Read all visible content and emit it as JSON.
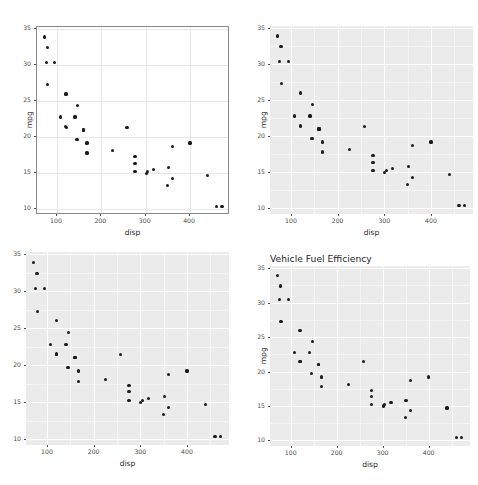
{
  "figure": {
    "kind": "scatterplot-matrix",
    "panel_count": 4,
    "background_color": "#ffffff",
    "point_color": "#1a1a1a"
  },
  "chart_data": [
    {
      "id": "top-left",
      "type": "scatter",
      "title": "",
      "xlabel": "disp",
      "ylabel": "mpg",
      "theme": "theme_bw",
      "panel_fill": "#ffffff",
      "panel_border": "#888888",
      "grid_color": "#e8e8e8",
      "grid": true,
      "legend": "none",
      "xlim": [
        55,
        490
      ],
      "ylim": [
        9.2,
        35.3
      ],
      "xticks": [
        100,
        200,
        300,
        400
      ],
      "yticks": [
        10,
        15,
        20,
        25,
        30,
        35
      ],
      "x": [
        160,
        160,
        108,
        258,
        360,
        225,
        360,
        146.7,
        140.8,
        167.6,
        167.6,
        275.8,
        275.8,
        275.8,
        472,
        460,
        440,
        78.7,
        75.7,
        71.1,
        120.1,
        318,
        304,
        350,
        400,
        79,
        120.3,
        95.1,
        351,
        145,
        301,
        121
      ],
      "y": [
        21,
        21,
        22.8,
        21.4,
        18.7,
        18.1,
        14.3,
        24.4,
        22.8,
        19.2,
        17.8,
        16.4,
        17.3,
        15.2,
        10.4,
        10.4,
        14.7,
        32.4,
        30.4,
        33.9,
        21.5,
        15.5,
        15.2,
        13.3,
        19.2,
        27.3,
        26,
        30.4,
        15.8,
        19.7,
        15,
        21.4
      ]
    },
    {
      "id": "top-right",
      "type": "scatter",
      "title": "",
      "xlabel": "disp",
      "ylabel": "mpg",
      "theme": "theme_gray",
      "panel_fill": "#ebebeb",
      "grid_color": "#ffffff",
      "grid": true,
      "legend": "none",
      "xlim": [
        55,
        490
      ],
      "ylim": [
        9.2,
        35.3
      ],
      "xticks": [
        100,
        200,
        300,
        400
      ],
      "yticks": [
        10,
        15,
        20,
        25,
        30,
        35
      ],
      "x": [
        160,
        160,
        108,
        258,
        360,
        225,
        360,
        146.7,
        140.8,
        167.6,
        167.6,
        275.8,
        275.8,
        275.8,
        472,
        460,
        440,
        78.7,
        75.7,
        71.1,
        120.1,
        318,
        304,
        350,
        400,
        79,
        120.3,
        95.1,
        351,
        145,
        301,
        121
      ],
      "y": [
        21,
        21,
        22.8,
        21.4,
        18.7,
        18.1,
        14.3,
        24.4,
        22.8,
        19.2,
        17.8,
        16.4,
        17.3,
        15.2,
        10.4,
        10.4,
        14.7,
        32.4,
        30.4,
        33.9,
        21.5,
        15.5,
        15.2,
        13.3,
        19.2,
        27.3,
        26,
        30.4,
        15.8,
        19.7,
        15,
        21.4
      ]
    },
    {
      "id": "bottom-left",
      "type": "scatter",
      "title": "",
      "xlabel": "disp",
      "ylabel": "",
      "theme": "theme_gray",
      "panel_fill": "#ebebeb",
      "grid_color": "#ffffff",
      "grid": true,
      "legend": "none",
      "xlim": [
        55,
        490
      ],
      "ylim": [
        9.2,
        35.3
      ],
      "xticks": [
        100,
        200,
        300,
        400
      ],
      "yticks": [
        10,
        15,
        20,
        25,
        30,
        35
      ],
      "x": [
        160,
        160,
        108,
        258,
        360,
        225,
        360,
        146.7,
        140.8,
        167.6,
        167.6,
        275.8,
        275.8,
        275.8,
        472,
        460,
        440,
        78.7,
        75.7,
        71.1,
        120.1,
        318,
        304,
        350,
        400,
        79,
        120.3,
        95.1,
        351,
        145,
        301,
        121
      ],
      "y": [
        21,
        21,
        22.8,
        21.4,
        18.7,
        18.1,
        14.3,
        24.4,
        22.8,
        19.2,
        17.8,
        16.4,
        17.3,
        15.2,
        10.4,
        10.4,
        14.7,
        32.4,
        30.4,
        33.9,
        21.5,
        15.5,
        15.2,
        13.3,
        19.2,
        27.3,
        26,
        30.4,
        15.8,
        19.7,
        15,
        21.4
      ]
    },
    {
      "id": "bottom-right",
      "type": "scatter",
      "title": "Vehicle Fuel Efficiency",
      "xlabel": "disp",
      "ylabel": "mpg",
      "theme": "theme_gray",
      "panel_fill": "#ebebeb",
      "grid_color": "#ffffff",
      "grid": true,
      "legend": "none",
      "xlim": [
        55,
        490
      ],
      "ylim": [
        9.2,
        35.3
      ],
      "xticks": [
        100,
        200,
        300,
        400
      ],
      "yticks": [
        10,
        15,
        20,
        25,
        30,
        35
      ],
      "x": [
        160,
        160,
        108,
        258,
        360,
        225,
        360,
        146.7,
        140.8,
        167.6,
        167.6,
        275.8,
        275.8,
        275.8,
        472,
        460,
        440,
        78.7,
        75.7,
        71.1,
        120.1,
        318,
        304,
        350,
        400,
        79,
        120.3,
        95.1,
        351,
        145,
        301,
        121
      ],
      "y": [
        21,
        21,
        22.8,
        21.4,
        18.7,
        18.1,
        14.3,
        24.4,
        22.8,
        19.2,
        17.8,
        16.4,
        17.3,
        15.2,
        10.4,
        10.4,
        14.7,
        32.4,
        30.4,
        33.9,
        21.5,
        15.5,
        15.2,
        13.3,
        19.2,
        27.3,
        26,
        30.4,
        15.8,
        19.7,
        15,
        21.4
      ]
    }
  ]
}
